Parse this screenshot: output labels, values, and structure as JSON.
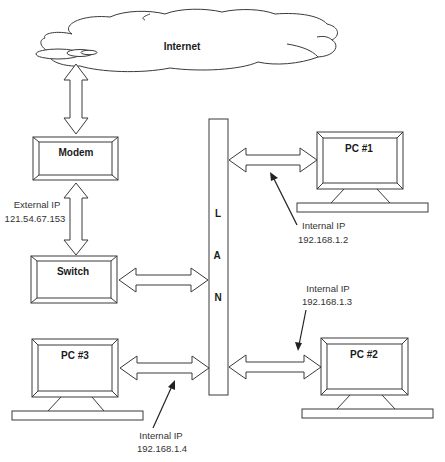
{
  "diagram": {
    "internet": {
      "label": "Internet"
    },
    "modem": {
      "label": "Modem"
    },
    "switch": {
      "label": "Switch"
    },
    "lan": {
      "letters": [
        "L",
        "A",
        "N"
      ]
    },
    "external_ip": {
      "caption": "External IP",
      "address": "121.54.67.153"
    },
    "pcs": [
      {
        "label": "PC #1",
        "ip_caption": "Internal IP",
        "ip": "192.168.1.2"
      },
      {
        "label": "PC #2",
        "ip_caption": "Internal IP",
        "ip": "192.168.1.3"
      },
      {
        "label": "PC #3",
        "ip_caption": "Internal IP",
        "ip": "192.168.1.4"
      }
    ],
    "colors": {
      "stroke": "#3a3a3a",
      "fill": "#ffffff",
      "text": "#1a1a1a"
    }
  }
}
